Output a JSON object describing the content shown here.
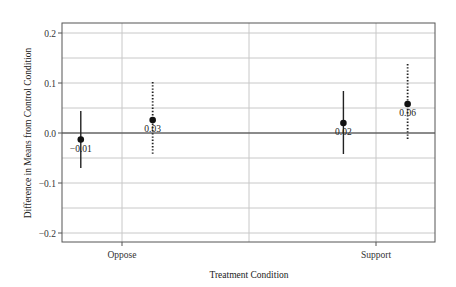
{
  "chart_data": {
    "type": "scatter",
    "subtype": "point-estimate-with-confidence-intervals",
    "title": "",
    "xlabel": "Treatment Condition",
    "ylabel": "Difference in Means from Control Condition",
    "categories": [
      "Oppose",
      "Support"
    ],
    "ylim": [
      -0.22,
      0.22
    ],
    "yticks": [
      -0.2,
      -0.1,
      0.0,
      0.1,
      0.2
    ],
    "ytick_labels": [
      "−0.2",
      "−0.1",
      "0.0",
      "0.1",
      "0.2"
    ],
    "minor_gridlines": [
      -0.15,
      -0.05,
      0.05,
      0.15
    ],
    "grid": true,
    "reference_line": 0.0,
    "legend": null,
    "series": [
      {
        "name": "Series 1 (solid CI)",
        "line_style": "solid",
        "points": [
          {
            "category": "Oppose",
            "offset": -0.43,
            "value": -0.013,
            "ci_low": -0.07,
            "ci_high": 0.044,
            "label": "−0.01"
          },
          {
            "category": "Support",
            "offset": -0.34,
            "value": 0.02,
            "ci_low": -0.042,
            "ci_high": 0.084,
            "label": "0.02"
          }
        ]
      },
      {
        "name": "Series 2 (dotted CI)",
        "line_style": "dotted",
        "points": [
          {
            "category": "Oppose",
            "offset": 0.32,
            "value": 0.026,
            "ci_low": -0.044,
            "ci_high": 0.102,
            "label": "0.03"
          },
          {
            "category": "Support",
            "offset": 0.33,
            "value": 0.058,
            "ci_low": -0.012,
            "ci_high": 0.138,
            "label": "0.06"
          }
        ]
      }
    ]
  },
  "axes": {
    "x_title": "Treatment Condition",
    "y_title": "Difference in Means from Control Condition",
    "x_tick_labels": [
      "Oppose",
      "Support"
    ]
  }
}
